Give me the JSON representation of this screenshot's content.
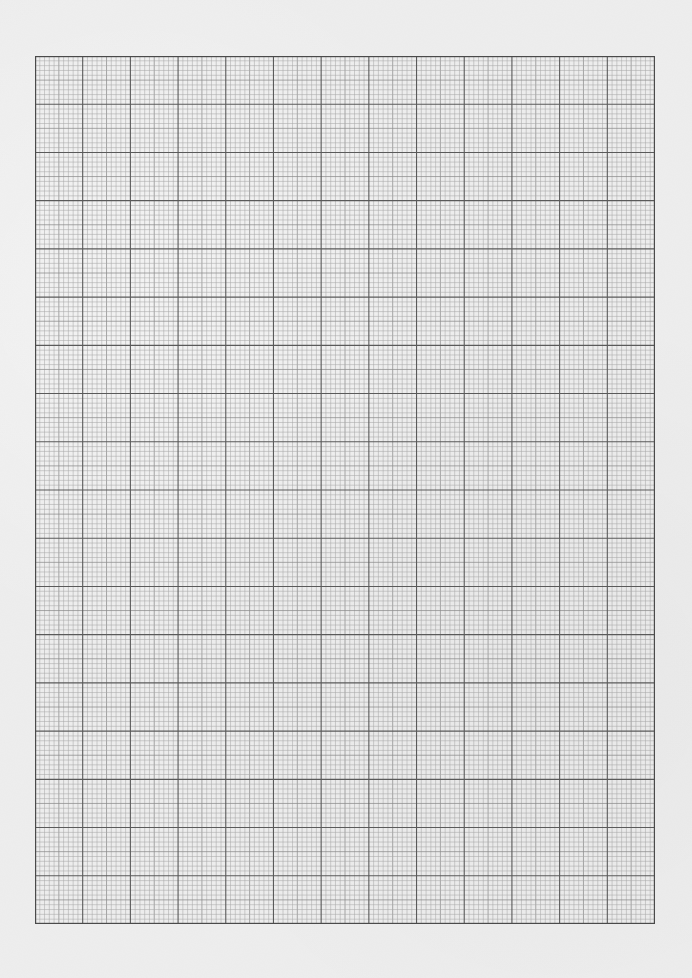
{
  "sheet": {
    "type": "graph-paper",
    "orientation": "portrait",
    "background_color": "#eeeeee",
    "grid": {
      "left": 35,
      "top": 56,
      "width": 620,
      "height": 868,
      "major_columns": 13,
      "major_rows": 18,
      "minor_per_major": 10,
      "major_line_color": "#5a5a5a",
      "minor_line_color": "#a8a8a8",
      "mid_line_color": "#8c8c8c",
      "border_color": "#4a4a4a"
    }
  }
}
